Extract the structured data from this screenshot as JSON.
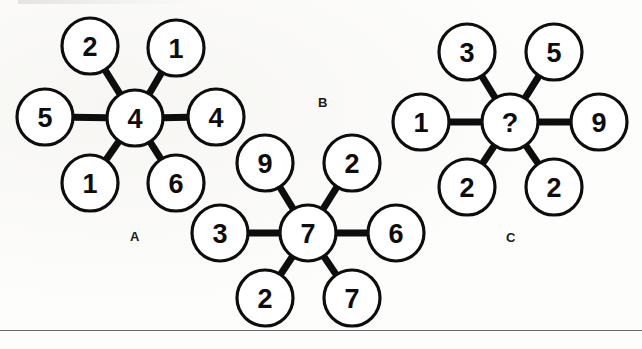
{
  "page": {
    "background_color": "#fdfdfc",
    "ink_color": "#0d0d0d",
    "width": 642,
    "height": 349
  },
  "style": {
    "circle_radius": 28,
    "circle_stroke_width": 3.2,
    "spoke_stroke_width": 7,
    "number_font_size": 27,
    "label_font_size": 13
  },
  "footer_rule": {
    "y": 330,
    "color": "#6d6d6d"
  },
  "clusters": [
    {
      "id": "cluster-a",
      "label": "A",
      "label_pos": {
        "x": 135,
        "y": 236
      },
      "center": {
        "value": "4",
        "x": 135,
        "y": 118
      },
      "spokes": [
        {
          "name": "top-left",
          "value": "2",
          "x": 90,
          "y": 46
        },
        {
          "name": "top-right",
          "value": "1",
          "x": 176,
          "y": 48
        },
        {
          "name": "left",
          "value": "5",
          "x": 45,
          "y": 117
        },
        {
          "name": "right",
          "value": "4",
          "x": 216,
          "y": 117
        },
        {
          "name": "bottom-left",
          "value": "1",
          "x": 90,
          "y": 183
        },
        {
          "name": "bottom-right",
          "value": "6",
          "x": 176,
          "y": 183
        }
      ]
    },
    {
      "id": "cluster-b",
      "label": "B",
      "label_pos": {
        "x": 323,
        "y": 102
      },
      "center": {
        "value": "7",
        "x": 308,
        "y": 233
      },
      "spokes": [
        {
          "name": "top-left",
          "value": "9",
          "x": 265,
          "y": 163
        },
        {
          "name": "top-right",
          "value": "2",
          "x": 352,
          "y": 163
        },
        {
          "name": "left",
          "value": "3",
          "x": 220,
          "y": 233
        },
        {
          "name": "right",
          "value": "6",
          "x": 396,
          "y": 233
        },
        {
          "name": "bottom-left",
          "value": "2",
          "x": 265,
          "y": 298
        },
        {
          "name": "bottom-right",
          "value": "7",
          "x": 352,
          "y": 298
        }
      ]
    },
    {
      "id": "cluster-c",
      "label": "C",
      "label_pos": {
        "x": 511,
        "y": 237
      },
      "center": {
        "value": "?",
        "x": 510,
        "y": 122
      },
      "spokes": [
        {
          "name": "top-left",
          "value": "3",
          "x": 467,
          "y": 52
        },
        {
          "name": "top-right",
          "value": "5",
          "x": 554,
          "y": 52
        },
        {
          "name": "left",
          "value": "1",
          "x": 421,
          "y": 122
        },
        {
          "name": "right",
          "value": "9",
          "x": 599,
          "y": 122
        },
        {
          "name": "bottom-left",
          "value": "2",
          "x": 467,
          "y": 187
        },
        {
          "name": "bottom-right",
          "value": "2",
          "x": 554,
          "y": 187
        }
      ]
    }
  ]
}
